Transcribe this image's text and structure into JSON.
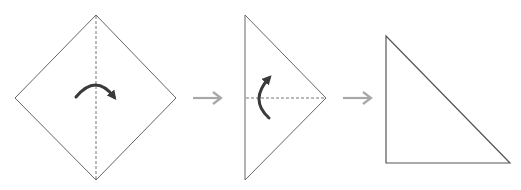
{
  "diagram": {
    "colors": {
      "paper_stroke": "#555555",
      "paper_fill": "#ffffff",
      "fold_line": "#666666",
      "fold_arrow": "#3a3a3a",
      "step_arrow": "#a8a8a8"
    },
    "steps": [
      {
        "id": 1,
        "shape": "square-diamond",
        "fold_line": "vertical-dashed",
        "fold_direction": "left-over-right"
      },
      {
        "id": 2,
        "shape": "right-pointing-triangle",
        "fold_line": "horizontal-dashed",
        "fold_direction": "bottom-up"
      },
      {
        "id": 3,
        "shape": "right-triangle",
        "fold_line": "none",
        "fold_direction": "none"
      }
    ],
    "transitions": [
      {
        "from": 1,
        "to": 2,
        "icon": "right-arrow-icon"
      },
      {
        "from": 2,
        "to": 3,
        "icon": "right-arrow-icon"
      }
    ]
  }
}
